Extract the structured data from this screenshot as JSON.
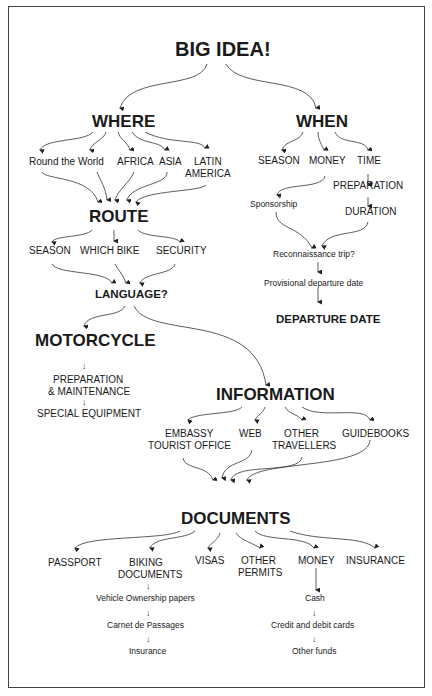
{
  "title": "BIG IDEA!",
  "branches": {
    "where": {
      "label": "WHERE",
      "children": [
        "Round the World",
        "AFRICA",
        "ASIA",
        "LATIN",
        "AMERICA"
      ]
    },
    "when": {
      "label": "WHEN",
      "children": [
        "SEASON",
        "MONEY",
        "TIME"
      ],
      "money_chain": [
        "Sponsorship"
      ],
      "time_chain": [
        "PREPARATION",
        "DURATION"
      ],
      "sequence": [
        "Reconnaissance trip?",
        "Provisional departure date",
        "DEPARTURE DATE"
      ]
    }
  },
  "route": {
    "label": "ROUTE",
    "children": [
      "SEASON",
      "WHICH BIKE",
      "SECURITY"
    ],
    "next": "LANGUAGE?"
  },
  "motorcycle": {
    "label": "MOTORCYCLE",
    "chain": [
      "PREPARATION",
      "& MAINTENANCE",
      "SPECIAL EQUIPMENT"
    ]
  },
  "information": {
    "label": "INFORMATION",
    "children": [
      "EMBASSY",
      "TOURIST OFFICE",
      "WEB",
      "OTHER",
      "TRAVELLERS",
      "GUIDEBOOKS"
    ]
  },
  "documents": {
    "label": "DOCUMENTS",
    "children": [
      "PASSPORT",
      "BIKING",
      "DOCUMENTS",
      "VISAS",
      "OTHER",
      "PERMITS",
      "MONEY",
      "INSURANCE"
    ],
    "biking_chain": [
      "Vehicle Ownership papers",
      "Carnet de Passages",
      "Insurance"
    ],
    "money_chain": [
      "Cash",
      "Credit and debit cards",
      "Other funds"
    ]
  },
  "arrow_glyph": "↓"
}
